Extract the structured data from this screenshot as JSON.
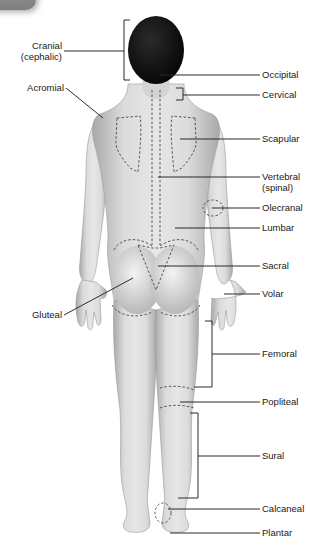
{
  "diagram": {
    "view": "posterior",
    "colors": {
      "background": "#ffffff",
      "skin": "#d9d9d9",
      "skin_shadow": "#a8a8a8",
      "hair": "#0d0d0d",
      "leader_line": "#2b2b2b",
      "text": "#1a1a1a",
      "corner_tab": "#8a8a8a"
    },
    "labels_left": [
      {
        "id": "cranial",
        "line1": "Cranial",
        "line2": "(cephalic)"
      },
      {
        "id": "acromial",
        "line1": "Acromial"
      },
      {
        "id": "gluteal",
        "line1": "Gluteal"
      }
    ],
    "labels_right": [
      {
        "id": "occipital",
        "line1": "Occipital"
      },
      {
        "id": "cervical",
        "line1": "Cervical"
      },
      {
        "id": "scapular",
        "line1": "Scapular"
      },
      {
        "id": "vertebral",
        "line1": "Vertebral",
        "line2": "(spinal)"
      },
      {
        "id": "olecranal",
        "line1": "Olecranal"
      },
      {
        "id": "lumbar",
        "line1": "Lumbar"
      },
      {
        "id": "sacral",
        "line1": "Sacral"
      },
      {
        "id": "volar",
        "line1": "Volar"
      },
      {
        "id": "femoral",
        "line1": "Femoral"
      },
      {
        "id": "popliteal",
        "line1": "Popliteal"
      },
      {
        "id": "sural",
        "line1": "Sural"
      },
      {
        "id": "calcaneal",
        "line1": "Calcaneal"
      },
      {
        "id": "plantar",
        "line1": "Plantar"
      }
    ]
  }
}
